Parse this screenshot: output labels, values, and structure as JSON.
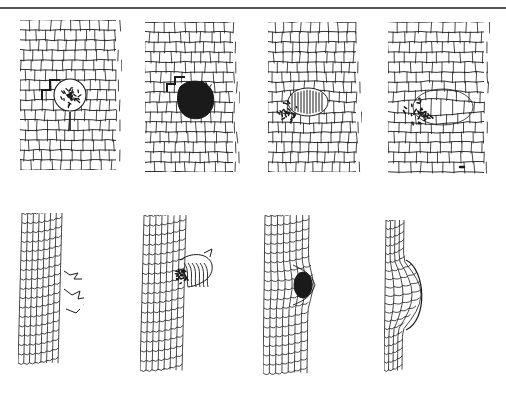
{
  "figure": {
    "rule_color": "#555555",
    "ink_color": "#1a1a1a",
    "top_row": [
      {
        "id": "panel-1",
        "lesion": "circular-ring",
        "x": 20,
        "y": 20,
        "w": 102,
        "h": 150
      },
      {
        "id": "panel-2",
        "lesion": "dark-blot",
        "x": 145,
        "y": 22,
        "w": 95,
        "h": 150
      },
      {
        "id": "panel-3",
        "lesion": "striated-oval",
        "x": 268,
        "y": 22,
        "w": 94,
        "h": 150
      },
      {
        "id": "panel-4",
        "lesion": "healed-oval",
        "x": 388,
        "y": 22,
        "w": 102,
        "h": 152
      }
    ],
    "bottom_row": [
      {
        "id": "panel-5",
        "lesion": "torn-edge",
        "x": 18,
        "y": 213,
        "w": 66,
        "h": 160
      },
      {
        "id": "panel-6",
        "lesion": "ruptured-tuft",
        "x": 140,
        "y": 215,
        "w": 76,
        "h": 160
      },
      {
        "id": "panel-7",
        "lesion": "dark-nodule",
        "x": 263,
        "y": 215,
        "w": 58,
        "h": 160
      },
      {
        "id": "panel-8",
        "lesion": "smooth-bulge",
        "x": 384,
        "y": 220,
        "w": 44,
        "h": 156
      }
    ]
  }
}
